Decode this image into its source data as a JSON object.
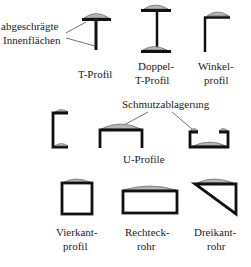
{
  "annotations": {
    "bevel_line1": "abgeschrägte",
    "bevel_line2": "Innenflächen",
    "dirt": "Schmutzablagerung"
  },
  "profiles": {
    "t_profile": {
      "label": "T-Profil"
    },
    "double_t": {
      "line1": "Doppel-",
      "line2": "T-Profil"
    },
    "angle": {
      "line1": "Winkel-",
      "line2": "profil"
    },
    "u_profiles": {
      "label": "U-Profile"
    },
    "square": {
      "line1": "Vierkant-",
      "line2": "profil"
    },
    "rect_tube": {
      "line1": "Rechteck-",
      "line2": "rohr"
    },
    "tri_tube": {
      "line1": "Dreikant-",
      "line2": "rohr"
    }
  },
  "colors": {
    "stroke": "#111111",
    "dirt": "#b5b5b5",
    "text": "#222222"
  }
}
